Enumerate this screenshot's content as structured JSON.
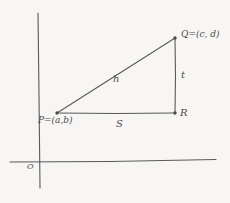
{
  "diagram": {
    "type": "right-triangle-distance-formula-sketch",
    "style": "hand-drawn pencil sketch on off-white paper",
    "background_color": "#f7f6f4",
    "stroke_color": "#5a5a5a",
    "axes": {
      "origin_label": "O",
      "x_axis_name": "x-axis",
      "y_axis_name": "y-axis",
      "x_axis": {
        "x1": 10,
        "y1": 162,
        "x2": 216,
        "y2": 160
      },
      "y_axis": {
        "x1": 38,
        "y1": 13,
        "x2": 40,
        "y2": 188
      },
      "origin_point": {
        "x": 39,
        "y": 161
      }
    },
    "vertices": [
      {
        "id": "P",
        "label": "P=(a,b)",
        "x": 57,
        "y": 113
      },
      {
        "id": "Q",
        "label": "Q=(c, d)",
        "x": 175,
        "y": 38
      },
      {
        "id": "R",
        "label": "R",
        "x": 175,
        "y": 113
      }
    ],
    "sides": [
      {
        "id": "hypotenuse",
        "label": "h",
        "from": "P",
        "to": "Q"
      },
      {
        "id": "vertical-leg",
        "label": "t",
        "from": "Q",
        "to": "R"
      },
      {
        "id": "horizontal-leg",
        "label": "S",
        "from": "P",
        "to": "R"
      }
    ]
  }
}
